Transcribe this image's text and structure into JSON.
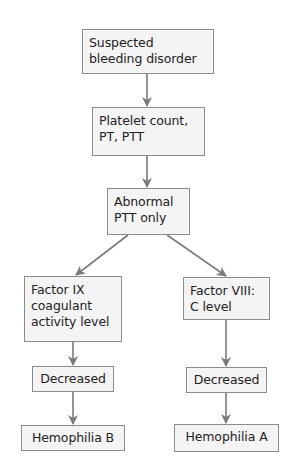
{
  "diagram": {
    "colors": {
      "box_fill": "#f4f4f4",
      "box_border": "#8c8c8c",
      "arrow": "#7a7a7a",
      "text": "#222222"
    },
    "nodes": {
      "suspected": "Suspected\nbleeding disorder",
      "screening": "Platelet count,\nPT, PTT",
      "abnormal_ptt": "Abnormal\nPTT only",
      "factor_ix": "Factor IX\ncoagulant\nactivity level",
      "factor_viii": "Factor VIII:\nC level",
      "decreased_left": "Decreased",
      "decreased_right": "Decreased",
      "hemophilia_b": "Hemophilia B",
      "hemophilia_a": "Hemophilia A"
    },
    "edges": [
      {
        "from": "suspected",
        "to": "screening"
      },
      {
        "from": "screening",
        "to": "abnormal_ptt"
      },
      {
        "from": "abnormal_ptt",
        "to": "factor_ix"
      },
      {
        "from": "abnormal_ptt",
        "to": "factor_viii"
      },
      {
        "from": "factor_ix",
        "to": "decreased_left"
      },
      {
        "from": "factor_viii",
        "to": "decreased_right"
      },
      {
        "from": "decreased_left",
        "to": "hemophilia_b"
      },
      {
        "from": "decreased_right",
        "to": "hemophilia_a"
      }
    ]
  }
}
